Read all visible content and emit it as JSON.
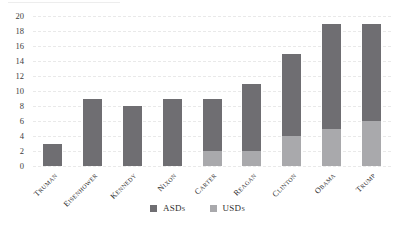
{
  "chart_data": {
    "type": "bar",
    "stacked": true,
    "title": "",
    "xlabel": "",
    "ylabel": "",
    "categories": [
      "Truman",
      "Eisenhower",
      "Kennedy",
      "Nixon",
      "Carter",
      "Reagan",
      "Clinton",
      "Obama",
      "Trump"
    ],
    "series": [
      {
        "name": "ASDs",
        "color": "#6f6e72",
        "values": [
          3,
          9,
          8,
          9,
          7,
          9,
          11,
          14,
          13
        ]
      },
      {
        "name": "USDs",
        "color": "#a9a9ac",
        "values": [
          0,
          0,
          0,
          0,
          2,
          2,
          4,
          5,
          6
        ]
      }
    ],
    "stack_order_bottom_to_top": [
      "USDs",
      "ASDs"
    ],
    "totals": [
      3,
      9,
      8,
      9,
      9,
      11,
      15,
      19,
      19
    ],
    "ylim": [
      0,
      20
    ],
    "yticks": [
      0,
      2,
      4,
      6,
      8,
      10,
      12,
      14,
      16,
      18,
      20
    ],
    "grid": true,
    "gridline_style": "dashed",
    "gridline_color": "#e9e9e9",
    "legend_position": "bottom",
    "legend_order": [
      "ASDs",
      "USDs"
    ]
  }
}
